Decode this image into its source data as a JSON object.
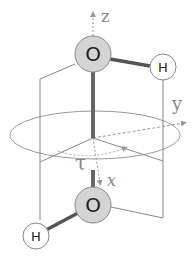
{
  "diagram": {
    "axes": {
      "z_label": "z",
      "y_label": "y",
      "x_label": "x"
    },
    "angle_label": "τ",
    "atoms": {
      "top_oxygen": "O",
      "top_hydrogen": "H",
      "bottom_oxygen": "O",
      "bottom_hydrogen": "H"
    },
    "colors": {
      "oxygen_fill": "#d4d4d4",
      "hydrogen_fill": "#ffffff",
      "bond": "#666666",
      "lines": "#888888",
      "axis": "#999999"
    }
  }
}
